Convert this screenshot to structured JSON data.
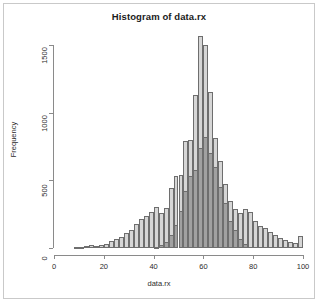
{
  "chart_data": {
    "type": "bar",
    "title": "Histogram of data.rx",
    "xlabel": "data.rx",
    "ylabel": "Frequency",
    "xlim": [
      0,
      100
    ],
    "ylim": [
      0,
      1600
    ],
    "grid": false,
    "legend": null,
    "bin_width": 2,
    "xticks": [
      0,
      20,
      40,
      60,
      80,
      100
    ],
    "yticks": [
      0,
      500,
      1000,
      1500
    ],
    "series": [
      {
        "name": "light-histogram",
        "color": "#d6d6d6",
        "bin_starts": [
          8,
          10,
          12,
          14,
          16,
          18,
          20,
          22,
          24,
          26,
          28,
          30,
          32,
          34,
          36,
          38,
          40,
          42,
          44,
          46,
          48,
          50,
          52,
          54,
          56,
          58,
          60,
          62,
          64,
          66,
          68,
          70,
          72,
          74,
          76,
          78,
          80,
          82,
          84,
          86,
          88,
          90,
          92,
          94,
          96,
          98
        ],
        "values": [
          4,
          8,
          14,
          22,
          18,
          20,
          26,
          55,
          70,
          85,
          110,
          130,
          180,
          215,
          240,
          265,
          300,
          255,
          295,
          440,
          530,
          540,
          790,
          800,
          1130,
          1570,
          1500,
          1150,
          810,
          640,
          470,
          350,
          290,
          255,
          290,
          265,
          200,
          165,
          150,
          115,
          95,
          75,
          62,
          48,
          35,
          90
        ]
      },
      {
        "name": "dark-histogram",
        "color": "#8c8c8c",
        "bin_starts": [
          40,
          42,
          44,
          46,
          48,
          50,
          52,
          54,
          56,
          58,
          60,
          62,
          64,
          66,
          68,
          70,
          72,
          74,
          76
        ],
        "values": [
          10,
          20,
          45,
          95,
          170,
          275,
          420,
          530,
          580,
          740,
          820,
          700,
          600,
          450,
          330,
          200,
          130,
          70,
          30
        ]
      }
    ]
  }
}
